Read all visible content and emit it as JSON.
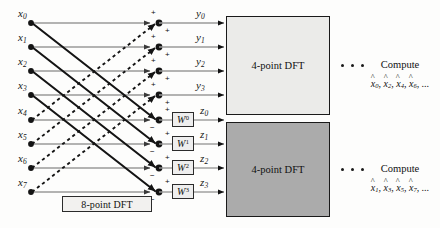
{
  "diagram": {
    "caption_8point": "8-point DFT",
    "inputs": [
      {
        "name": "x",
        "index": "0"
      },
      {
        "name": "x",
        "index": "1"
      },
      {
        "name": "x",
        "index": "2"
      },
      {
        "name": "x",
        "index": "3"
      },
      {
        "name": "x",
        "index": "4"
      },
      {
        "name": "x",
        "index": "5"
      },
      {
        "name": "x",
        "index": "6"
      },
      {
        "name": "x",
        "index": "7"
      }
    ],
    "outputs_top": [
      {
        "name": "y",
        "index": "0"
      },
      {
        "name": "y",
        "index": "1"
      },
      {
        "name": "y",
        "index": "2"
      },
      {
        "name": "y",
        "index": "3"
      }
    ],
    "outputs_bottom": [
      {
        "name": "z",
        "index": "0"
      },
      {
        "name": "z",
        "index": "1"
      },
      {
        "name": "z",
        "index": "2"
      },
      {
        "name": "z",
        "index": "3"
      }
    ],
    "twiddles": [
      {
        "base": "W",
        "exp": "0"
      },
      {
        "base": "W",
        "exp": "1"
      },
      {
        "base": "W",
        "exp": "2"
      },
      {
        "base": "W",
        "exp": "3"
      }
    ],
    "node_signs": [
      {
        "top": "+",
        "bottom": "+"
      },
      {
        "top": "+",
        "bottom": "+"
      },
      {
        "top": "+",
        "bottom": "+"
      },
      {
        "top": "+",
        "bottom": "+"
      },
      {
        "top": "+",
        "bottom": "−"
      },
      {
        "top": "+",
        "bottom": "−"
      },
      {
        "top": "+",
        "bottom": "−"
      },
      {
        "top": "+",
        "bottom": "−"
      }
    ],
    "blocks": [
      {
        "id": "dft-top",
        "label": "4-point DFT",
        "fill": "#ebebe9"
      },
      {
        "id": "dft-bottom",
        "label": "4-point DFT",
        "fill": "#ababab"
      }
    ],
    "compute_top": {
      "heading": "Compute",
      "terms": [
        "0",
        "2",
        "4",
        "6"
      ],
      "symbol": "x",
      "ellipsis": "..."
    },
    "compute_bottom": {
      "heading": "Compute",
      "terms": [
        "1",
        "3",
        "5",
        "7"
      ],
      "symbol": "x",
      "ellipsis": "..."
    },
    "colors": {
      "line": "#9a9a9a",
      "cross_solid": "#141414",
      "cross_dashed": "#141414",
      "node": "#141414",
      "block_top": "#ebebe9",
      "block_bottom": "#ababab"
    }
  }
}
